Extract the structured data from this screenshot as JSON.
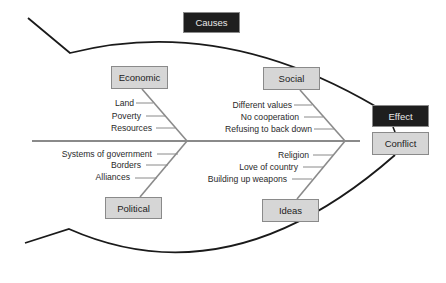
{
  "diagram": {
    "type": "fishbone",
    "header": {
      "causes_label": "Causes"
    },
    "effect": {
      "title": "Effect",
      "value": "Conflict"
    },
    "categories": [
      {
        "name": "Economic",
        "position": "top-left",
        "causes": [
          "Land",
          "Poverty",
          "Resources"
        ]
      },
      {
        "name": "Social",
        "position": "top-right",
        "causes": [
          "Different values",
          "No cooperation",
          "Refusing to back down"
        ]
      },
      {
        "name": "Political",
        "position": "bottom-left",
        "causes": [
          "Systems of government",
          "Borders",
          "Alliances"
        ]
      },
      {
        "name": "Ideas",
        "position": "bottom-right",
        "causes": [
          "Religion",
          "Love of country",
          "Building up weapons"
        ]
      }
    ],
    "colors": {
      "category_fill": "#d6d6d6",
      "dark_fill": "#1e1e1e",
      "line": "#8a8a8a",
      "outline": "#1a1a1a"
    }
  }
}
